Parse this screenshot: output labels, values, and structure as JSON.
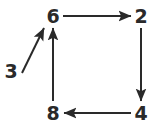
{
  "diagram": {
    "type": "directed-graph",
    "background_color": "#ffffff",
    "stroke_color": "#2a2a2a",
    "text_color": "#2a2a2a",
    "stroke_width": 2,
    "canvas": {
      "width": 159,
      "height": 129
    },
    "nodes": [
      {
        "id": "n6",
        "label": "6",
        "x": 53,
        "y": 16
      },
      {
        "id": "n2",
        "label": "2",
        "x": 141,
        "y": 16
      },
      {
        "id": "n8",
        "label": "8",
        "x": 53,
        "y": 113
      },
      {
        "id": "n4",
        "label": "4",
        "x": 141,
        "y": 113
      },
      {
        "id": "n3",
        "label": "3",
        "x": 11,
        "y": 71
      }
    ],
    "edges": [
      {
        "id": "e6-2",
        "from": "6",
        "to": "2",
        "direction": "right",
        "x1": 63,
        "y1": 16,
        "x2": 131,
        "y2": 16
      },
      {
        "id": "e2-4",
        "from": "2",
        "to": "4",
        "direction": "down",
        "x1": 141,
        "y1": 28,
        "x2": 141,
        "y2": 101
      },
      {
        "id": "e4-8",
        "from": "4",
        "to": "8",
        "direction": "left",
        "x1": 131,
        "y1": 113,
        "x2": 64,
        "y2": 113
      },
      {
        "id": "e8-6",
        "from": "8",
        "to": "6",
        "direction": "up",
        "x1": 53,
        "y1": 101,
        "x2": 53,
        "y2": 28
      },
      {
        "id": "e3-6",
        "from": "3",
        "to": "6",
        "direction": "up-right",
        "x1": 22,
        "y1": 73,
        "x2": 44,
        "y2": 28
      }
    ]
  }
}
